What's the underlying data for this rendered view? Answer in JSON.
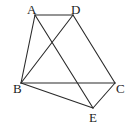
{
  "diagram": {
    "type": "geometry",
    "points": {
      "A": {
        "label": "A",
        "x": 35,
        "y": 15,
        "lx": 27,
        "ly": 14
      },
      "D": {
        "label": "D",
        "x": 73,
        "y": 15,
        "lx": 71,
        "ly": 14
      },
      "B": {
        "label": "B",
        "x": 21,
        "y": 83,
        "lx": 13,
        "ly": 93
      },
      "C": {
        "label": "C",
        "x": 115,
        "y": 83,
        "lx": 116,
        "ly": 93
      },
      "E": {
        "label": "E",
        "x": 93,
        "y": 108,
        "lx": 89,
        "ly": 122
      }
    },
    "segments": [
      [
        "A",
        "D"
      ],
      [
        "A",
        "B"
      ],
      [
        "A",
        "E"
      ],
      [
        "B",
        "D"
      ],
      [
        "B",
        "C"
      ],
      [
        "B",
        "E"
      ],
      [
        "D",
        "C"
      ],
      [
        "C",
        "E"
      ]
    ],
    "colors": {
      "line": "#2a2a2a",
      "text": "#222222",
      "background": "#ffffff"
    }
  }
}
